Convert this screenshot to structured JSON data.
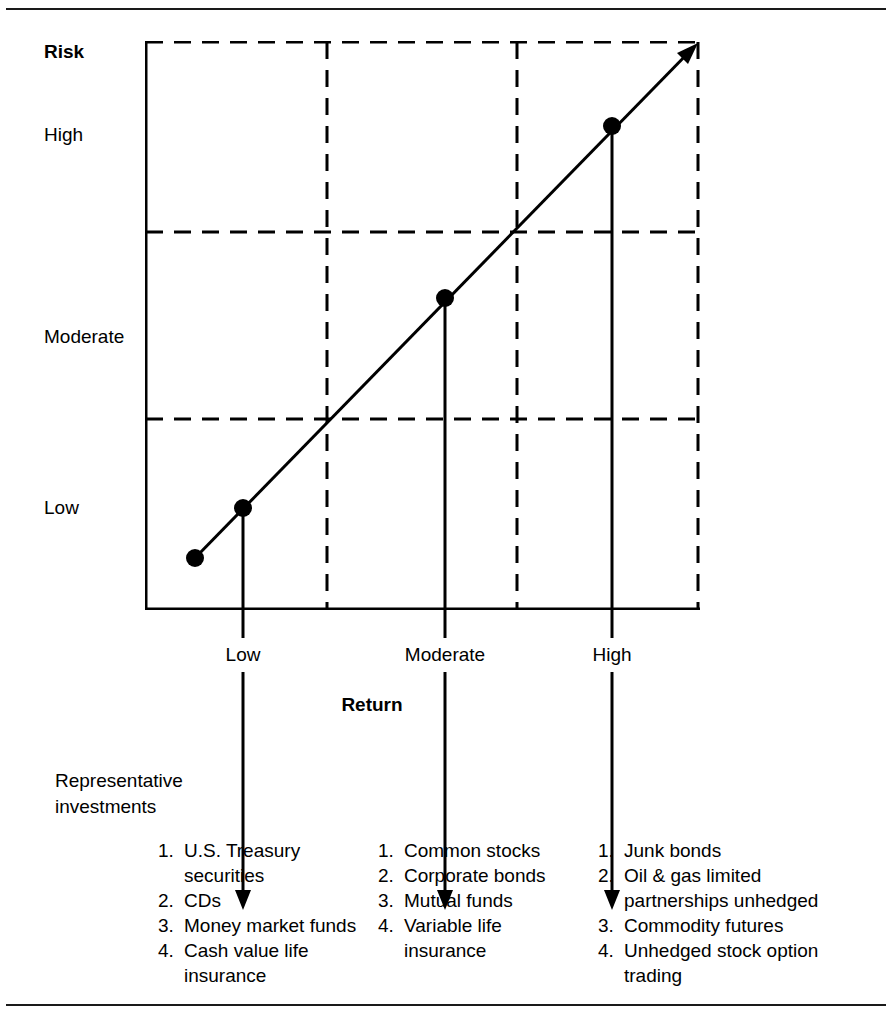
{
  "figure": {
    "y_axis_title": "Risk",
    "x_axis_title": "Return",
    "rep_label_line1": "Representative",
    "rep_label_line2": "investments"
  },
  "chart_data": {
    "type": "line",
    "title": "",
    "subtitle": "",
    "xlabel": "Return",
    "ylabel": "Risk",
    "grid": true,
    "legend": "none",
    "x_tick_labels": [
      "Low",
      "Moderate",
      "High"
    ],
    "y_tick_labels": [
      "Low",
      "Moderate",
      "High"
    ],
    "x": [
      "",
      "Low",
      "Moderate",
      "High"
    ],
    "series": [
      {
        "name": "Risk / return relationship",
        "points": [
          {
            "x": "origin",
            "return": "",
            "risk": ""
          },
          {
            "x": "Low",
            "return": "Low",
            "risk": "Low"
          },
          {
            "x": "Moderate",
            "return": "Moderate",
            "risk": "Moderate"
          },
          {
            "x": "High",
            "return": "High",
            "risk": "High"
          }
        ]
      }
    ],
    "annotations": [
      "Diagonal arrow indicates risk rises together with return",
      "Dashed gridlines divide the plot into a 3 x 3 grid"
    ],
    "xlim": [
      "Low",
      "High"
    ],
    "ylim": [
      "Low",
      "High"
    ]
  },
  "investments": {
    "columns": [
      {
        "tier": "Low",
        "items": [
          {
            "num": "1.",
            "text": "U.S. Treasury securities"
          },
          {
            "num": "2.",
            "text": "CDs"
          },
          {
            "num": "3.",
            "text": "Money market funds"
          },
          {
            "num": "4.",
            "text": "Cash value life insurance"
          }
        ]
      },
      {
        "tier": "Moderate",
        "items": [
          {
            "num": "1.",
            "text": "Common stocks"
          },
          {
            "num": "2.",
            "text": "Corporate bonds"
          },
          {
            "num": "3.",
            "text": "Mutual funds"
          },
          {
            "num": "4.",
            "text": "Variable life insurance"
          }
        ]
      },
      {
        "tier": "High",
        "items": [
          {
            "num": "1.",
            "text": "Junk bonds"
          },
          {
            "num": "2.",
            "text": "Oil & gas limited partnerships unhedged"
          },
          {
            "num": "3.",
            "text": "Commodity futures"
          },
          {
            "num": "4.",
            "text": "Unhedged stock option trading"
          }
        ]
      }
    ]
  },
  "colors": {
    "ink": "#000000",
    "rule": "#1a1a1a",
    "background": "#ffffff"
  }
}
